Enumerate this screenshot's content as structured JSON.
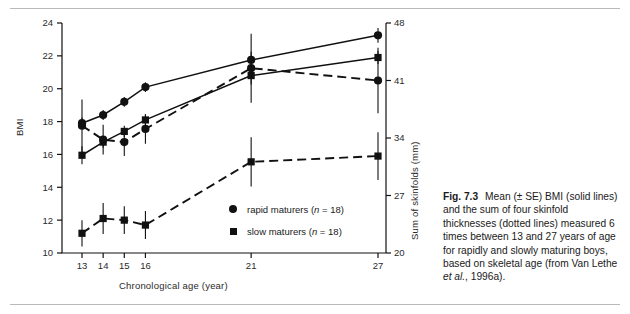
{
  "figure": {
    "caption_label": "Fig. 7.3",
    "caption_text": "Mean (± SE) BMI (solid lines) and the sum of four skinfold thicknesses (dotted lines) measured 6 times between 13 and 27 years of age for rapidly and slowly maturing boys, based on skeletal age (from Van Lethe ",
    "caption_italic": "et al.",
    "caption_tail": ", 1996a)."
  },
  "chart_data": {
    "type": "line",
    "title": "",
    "xlabel": "Chronological age (year)",
    "ylabel": "BMI",
    "ylabel_right": "Sum of skinfolds (mm)",
    "x": [
      13,
      14,
      15,
      16,
      21,
      27
    ],
    "xticklabels": [
      "13",
      "14",
      "15",
      "16",
      "21",
      "27"
    ],
    "xlim": [
      12.4,
      28.0
    ],
    "ylim": [
      10,
      24
    ],
    "yticks": [
      10,
      12,
      14,
      16,
      18,
      20,
      22,
      24
    ],
    "yticklabels": [
      "10",
      "12",
      "14",
      "16",
      "18",
      "20",
      "22",
      "24"
    ],
    "y2ticks": [
      20,
      27,
      34,
      41,
      48
    ],
    "y2ticklabels": [
      "20",
      "27",
      "34",
      "41",
      "48"
    ],
    "y2lim": [
      20,
      48
    ],
    "grid": false,
    "legend_position": "inside-lower-right",
    "series": [
      {
        "name": "rapid maturers (n = 18)",
        "marker": "circle",
        "linestyle": "solid",
        "axis": "left",
        "quantity": "BMI",
        "values": [
          17.9,
          18.4,
          19.2,
          20.1,
          21.75,
          23.25
        ],
        "errors": [
          0.35,
          0.3,
          0.3,
          0.3,
          0.5,
          0.45
        ]
      },
      {
        "name": "slow maturers (n = 18)",
        "marker": "square",
        "linestyle": "solid",
        "axis": "left",
        "quantity": "BMI",
        "values": [
          15.95,
          16.75,
          17.4,
          18.1,
          20.8,
          21.9
        ],
        "errors": [
          0.55,
          0.35,
          0.35,
          0.35,
          0.55,
          0.4
        ]
      },
      {
        "name": "rapid maturers (n = 18)",
        "marker": "circle",
        "linestyle": "dashed",
        "axis": "right",
        "quantity": "Sum of skinfolds (mm)",
        "values": [
          35.5,
          33.8,
          33.5,
          35.1,
          42.5,
          41.0
        ],
        "errors": [
          3.2,
          1.8,
          1.7,
          1.8,
          4.2,
          4.0
        ]
      },
      {
        "name": "slow maturers (n = 18)",
        "marker": "square",
        "linestyle": "dashed",
        "axis": "right",
        "quantity": "Sum of skinfolds (mm)",
        "values": [
          22.4,
          24.2,
          24.0,
          23.4,
          31.1,
          31.8
        ],
        "errors": [
          1.6,
          1.9,
          1.7,
          1.7,
          3.0,
          2.9
        ]
      }
    ],
    "legend": [
      {
        "marker": "circle",
        "label_text": "rapid maturers (",
        "label_italic": "n",
        "label_tail": " = 18)"
      },
      {
        "marker": "square",
        "label_text": "slow maturers (",
        "label_italic": "n",
        "label_tail": " = 18)"
      }
    ]
  }
}
